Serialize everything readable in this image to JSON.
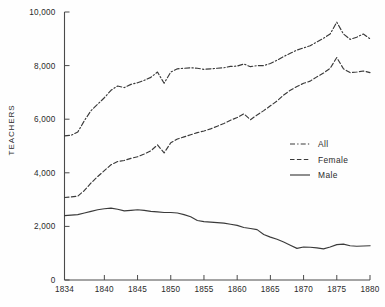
{
  "chart_data": {
    "type": "line",
    "title": "",
    "xlabel": "",
    "ylabel": "TEACHERS",
    "xlim": [
      1834,
      1880
    ],
    "ylim": [
      0,
      10000
    ],
    "grid": false,
    "legend_position": "right-middle",
    "xticks": [
      "1834",
      "1840",
      "1845",
      "1850",
      "1855",
      "1860",
      "1865",
      "1870",
      "1875",
      "1880"
    ],
    "xtick_values": [
      1834,
      1840,
      1845,
      1850,
      1855,
      1860,
      1865,
      1870,
      1875,
      1880
    ],
    "yticks": [
      "0",
      "2,000",
      "4,000",
      "6,000",
      "8,000",
      "10,000"
    ],
    "ytick_values": [
      0,
      2000,
      4000,
      6000,
      8000,
      10000
    ],
    "x": [
      1834,
      1835,
      1836,
      1837,
      1838,
      1839,
      1840,
      1841,
      1842,
      1843,
      1844,
      1845,
      1846,
      1847,
      1848,
      1849,
      1850,
      1851,
      1852,
      1853,
      1854,
      1855,
      1856,
      1857,
      1858,
      1859,
      1860,
      1861,
      1862,
      1863,
      1864,
      1865,
      1866,
      1867,
      1868,
      1869,
      1870,
      1871,
      1872,
      1873,
      1874,
      1875,
      1876,
      1877,
      1878,
      1879,
      1880
    ],
    "series": [
      {
        "name": "All",
        "style": "dash-dot",
        "color": "#3a3a3a",
        "values": [
          5380,
          5400,
          5520,
          5950,
          6320,
          6560,
          6800,
          7080,
          7240,
          7180,
          7300,
          7360,
          7450,
          7560,
          7760,
          7340,
          7760,
          7880,
          7900,
          7920,
          7900,
          7860,
          7880,
          7900,
          7920,
          7970,
          7980,
          8060,
          7960,
          8000,
          8000,
          8080,
          8200,
          8340,
          8460,
          8580,
          8660,
          8740,
          8880,
          9020,
          9180,
          9620,
          9180,
          8980,
          9060,
          9180,
          9000
        ]
      },
      {
        "name": "Female",
        "style": "dashed",
        "color": "#3a3a3a",
        "values": [
          3080,
          3100,
          3130,
          3340,
          3620,
          3860,
          4080,
          4300,
          4420,
          4460,
          4540,
          4600,
          4700,
          4820,
          5040,
          4740,
          5120,
          5260,
          5340,
          5420,
          5500,
          5560,
          5640,
          5740,
          5840,
          5960,
          6060,
          6200,
          5980,
          6160,
          6320,
          6500,
          6680,
          6900,
          7080,
          7220,
          7340,
          7420,
          7580,
          7720,
          7900,
          8300,
          7880,
          7740,
          7760,
          7800,
          7740
        ]
      },
      {
        "name": "Male",
        "style": "solid",
        "color": "#3a3a3a",
        "values": [
          2400,
          2420,
          2440,
          2500,
          2560,
          2620,
          2660,
          2680,
          2640,
          2580,
          2600,
          2620,
          2600,
          2560,
          2540,
          2520,
          2520,
          2500,
          2440,
          2360,
          2220,
          2180,
          2160,
          2140,
          2120,
          2080,
          2040,
          1960,
          1920,
          1880,
          1700,
          1600,
          1520,
          1420,
          1300,
          1180,
          1230,
          1220,
          1200,
          1160,
          1230,
          1320,
          1340,
          1280,
          1260,
          1270,
          1280
        ]
      }
    ]
  },
  "legend": {
    "items": [
      {
        "label": "All",
        "style": "dash-dot"
      },
      {
        "label": "Female",
        "style": "dashed"
      },
      {
        "label": "Male",
        "style": "solid"
      }
    ]
  }
}
